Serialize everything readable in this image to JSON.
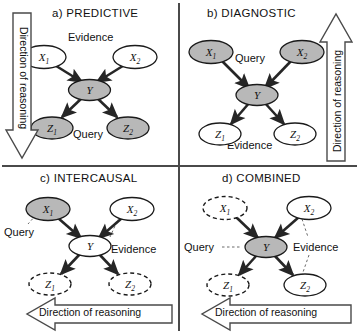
{
  "figure": {
    "caption_style": "four-panel bayesian network reasoning patterns",
    "colors": {
      "shaded_node_fill": "#b8b8b8",
      "plain_node_fill": "#ffffff",
      "node_stroke": "#1a1a1a",
      "arrow": "#262626",
      "leader_line": "#6b6b6b",
      "divider": "#4a4a4a",
      "background": "#ffffff"
    },
    "node_labels": {
      "x1": "X",
      "x1_sub": "1",
      "x2": "X",
      "x2_sub": "2",
      "y": "Y",
      "z1": "Z",
      "z1_sub": "1",
      "z2": "Z",
      "z2_sub": "2"
    },
    "direction_label": "Direction of reasoning"
  },
  "panels": [
    {
      "id": "predictive",
      "title": "a)  PREDICTIVE",
      "nodes": {
        "x1": {
          "label": "X₁",
          "fill": "plain",
          "border": "solid"
        },
        "x2": {
          "label": "X₂",
          "fill": "plain",
          "border": "solid"
        },
        "y": {
          "label": "Y",
          "fill": "shaded",
          "border": "solid"
        },
        "z1": {
          "label": "Z₁",
          "fill": "shaded",
          "border": "solid"
        },
        "z2": {
          "label": "Z₂",
          "fill": "shaded",
          "border": "solid"
        }
      },
      "annotations": [
        {
          "name": "evidence-label",
          "text": "Evidence",
          "position": "top-center"
        },
        {
          "name": "query-label",
          "text": "Query",
          "position": "bottom-center"
        }
      ],
      "direction": {
        "text": "Direction of reasoning",
        "orientation": "down",
        "placement": "left"
      }
    },
    {
      "id": "diagnostic",
      "title": "b)  DIAGNOSTIC",
      "nodes": {
        "x1": {
          "label": "X₁",
          "fill": "shaded",
          "border": "solid"
        },
        "x2": {
          "label": "X₂",
          "fill": "shaded",
          "border": "solid"
        },
        "y": {
          "label": "Y",
          "fill": "shaded",
          "border": "solid"
        },
        "z1": {
          "label": "Z₁",
          "fill": "plain",
          "border": "solid"
        },
        "z2": {
          "label": "Z₂",
          "fill": "plain",
          "border": "solid"
        }
      },
      "annotations": [
        {
          "name": "query-label",
          "text": "Query",
          "position": "top-center"
        },
        {
          "name": "evidence-label",
          "text": "Evidence",
          "position": "bottom-center"
        }
      ],
      "direction": {
        "text": "Direction of reasoning",
        "orientation": "up",
        "placement": "right"
      }
    },
    {
      "id": "intercausal",
      "title": "c)  INTERCAUSAL",
      "nodes": {
        "x1": {
          "label": "X₁",
          "fill": "shaded",
          "border": "solid"
        },
        "x2": {
          "label": "X₂",
          "fill": "plain",
          "border": "solid"
        },
        "y": {
          "label": "Y",
          "fill": "plain",
          "border": "solid"
        },
        "z1": {
          "label": "Z₁",
          "fill": "plain",
          "border": "dashed"
        },
        "z2": {
          "label": "Z₂",
          "fill": "plain",
          "border": "dashed"
        }
      },
      "annotations": [
        {
          "name": "query-label",
          "text": "Query",
          "position": "left-of-x1"
        },
        {
          "name": "evidence-label",
          "text": "Evidence",
          "position": "right-of-y"
        }
      ],
      "direction": {
        "text": "Direction of reasoning",
        "orientation": "left",
        "placement": "bottom"
      }
    },
    {
      "id": "combined",
      "title": "d)  COMBINED",
      "nodes": {
        "x1": {
          "label": "X₁",
          "fill": "plain",
          "border": "dashed"
        },
        "x2": {
          "label": "X₂",
          "fill": "plain",
          "border": "solid"
        },
        "y": {
          "label": "Y",
          "fill": "shaded",
          "border": "solid"
        },
        "z1": {
          "label": "Z₁",
          "fill": "plain",
          "border": "dashed"
        },
        "z2": {
          "label": "Z₂",
          "fill": "plain",
          "border": "solid"
        }
      },
      "annotations": [
        {
          "name": "query-label",
          "text": "Query",
          "position": "left-of-y"
        },
        {
          "name": "evidence-label",
          "text": "Evidence",
          "position": "right-of-y"
        }
      ],
      "direction": {
        "text": "Direction of reasoning",
        "orientation": "left",
        "placement": "bottom"
      }
    }
  ]
}
